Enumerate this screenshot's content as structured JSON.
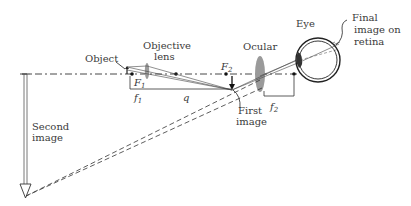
{
  "diagram": {
    "labels": {
      "object": "Object",
      "objective_line1": "Objective",
      "objective_line2": "lens",
      "ocular": "Ocular",
      "eye": "Eye",
      "final_line1": "Final",
      "final_line2": "image on",
      "final_line3": "retina",
      "first_line1": "First",
      "first_line2": "image",
      "second_line1": "Second",
      "second_line2": "image",
      "F1": "F",
      "F1_sub": "1",
      "F2": "F",
      "F2_sub": "2",
      "f1": "f",
      "f1_sub": "1",
      "f2": "f",
      "f2_sub": "2",
      "q": "q"
    },
    "colors": {
      "line": "#2a2a2a",
      "lens": "#9a9a9a",
      "text": "#3a3a3a"
    }
  }
}
